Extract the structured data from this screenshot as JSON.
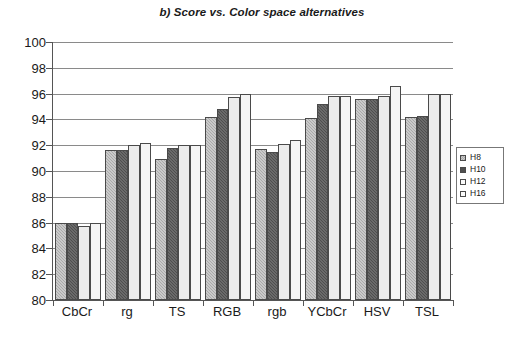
{
  "chart_data": {
    "type": "bar",
    "title": "b) Score vs. Color space alternatives",
    "xlabel": "",
    "ylabel": "",
    "ylim": [
      80,
      100
    ],
    "ytick_step": 2,
    "yticks": [
      80,
      82,
      84,
      86,
      88,
      90,
      92,
      94,
      96,
      98,
      100
    ],
    "grid": true,
    "grid_axis": "y",
    "legend_position": "right",
    "categories": [
      "CbCr",
      "rg",
      "TS",
      "RGB",
      "rgb",
      "YCbCr",
      "HSV",
      "TSL"
    ],
    "series": [
      {
        "name": "H8",
        "values": [
          86.0,
          91.6,
          90.9,
          94.2,
          91.7,
          94.1,
          95.6,
          94.2
        ]
      },
      {
        "name": "H10",
        "values": [
          86.0,
          91.6,
          91.8,
          94.8,
          91.5,
          95.2,
          95.6,
          94.3
        ]
      },
      {
        "name": "H12",
        "values": [
          85.7,
          92.0,
          92.0,
          95.7,
          92.1,
          95.8,
          95.8,
          96.0
        ]
      },
      {
        "name": "H16",
        "values": [
          86.0,
          92.2,
          92.0,
          96.0,
          92.4,
          95.8,
          96.6,
          96.0
        ]
      }
    ],
    "series_colors": [
      "#a9a9a9",
      "#4e4e4e",
      "#ececec",
      "#f4f4f4"
    ]
  }
}
